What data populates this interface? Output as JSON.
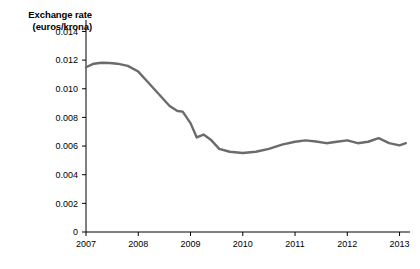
{
  "chart_data": {
    "type": "line",
    "title": "Exchange rate (euros/krona)",
    "title_line1": "Exchange rate",
    "title_line2": "(euros/krona)",
    "xlabel": "",
    "ylabel": "Exchange rate (euros/krona)",
    "xlim": [
      2007,
      2013.2
    ],
    "ylim": [
      0,
      0.0148
    ],
    "grid": false,
    "legend": null,
    "line_color": "#6b6b6b",
    "axis_color": "#000000",
    "yticks": [
      0,
      0.002,
      0.004,
      0.006,
      0.008,
      0.01,
      0.012,
      0.014
    ],
    "ytick_labels": [
      "0",
      "0.002",
      "0.004",
      "0.006",
      "0.008",
      "0.010",
      "0.012",
      "0.014"
    ],
    "xticks": [
      2007,
      2008,
      2009,
      2010,
      2011,
      2012,
      2013
    ],
    "xtick_labels": [
      "2007",
      "2008",
      "2009",
      "2010",
      "2011",
      "2012",
      "2013"
    ],
    "series": [
      {
        "name": "Exchange rate (euros/krona)",
        "x": [
          2007.0,
          2007.15,
          2007.3,
          2007.45,
          2007.6,
          2007.8,
          2008.0,
          2008.2,
          2008.4,
          2008.6,
          2008.75,
          2008.85,
          2009.0,
          2009.12,
          2009.25,
          2009.4,
          2009.55,
          2009.75,
          2010.0,
          2010.25,
          2010.5,
          2010.75,
          2011.0,
          2011.2,
          2011.4,
          2011.6,
          2011.8,
          2012.0,
          2012.2,
          2012.4,
          2012.6,
          2012.8,
          2013.0,
          2013.12
        ],
        "y": [
          0.0115,
          0.01175,
          0.01182,
          0.0118,
          0.01175,
          0.0116,
          0.0112,
          0.0104,
          0.0096,
          0.0088,
          0.00845,
          0.0084,
          0.0076,
          0.0066,
          0.0068,
          0.0064,
          0.0058,
          0.0056,
          0.00552,
          0.0056,
          0.0058,
          0.0061,
          0.0063,
          0.0064,
          0.00632,
          0.0062,
          0.0063,
          0.0064,
          0.0062,
          0.0063,
          0.00655,
          0.0062,
          0.00605,
          0.0062
        ]
      }
    ]
  }
}
